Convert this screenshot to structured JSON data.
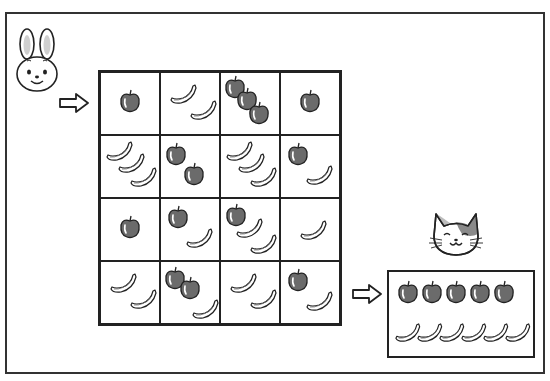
{
  "puzzle": {
    "title": "Fruit grid path puzzle",
    "start_character": "rabbit",
    "end_character": "cat",
    "grid": {
      "rows": 4,
      "cols": 4,
      "cells": [
        [
          {
            "apples": 1,
            "bananas": 0
          },
          {
            "apples": 0,
            "bananas": 2
          },
          {
            "apples": 3,
            "bananas": 0
          },
          {
            "apples": 1,
            "bananas": 0
          }
        ],
        [
          {
            "apples": 0,
            "bananas": 3
          },
          {
            "apples": 2,
            "bananas": 0
          },
          {
            "apples": 0,
            "bananas": 3
          },
          {
            "apples": 1,
            "bananas": 1
          }
        ],
        [
          {
            "apples": 1,
            "bananas": 0
          },
          {
            "apples": 1,
            "bananas": 1
          },
          {
            "apples": 1,
            "bananas": 2
          },
          {
            "apples": 0,
            "bananas": 1
          }
        ],
        [
          {
            "apples": 0,
            "bananas": 2
          },
          {
            "apples": 2,
            "bananas": 1
          },
          {
            "apples": 0,
            "bananas": 2
          },
          {
            "apples": 1,
            "bananas": 1
          }
        ]
      ]
    },
    "entry": {
      "row": 0,
      "side": "left"
    },
    "exit": {
      "row": 3,
      "side": "right"
    },
    "target": {
      "apples": 5,
      "bananas": 6
    }
  },
  "icons": {
    "start": "rabbit-face-icon",
    "end": "cat-face-icon",
    "arrow": "right-arrow-icon",
    "apple": "apple-icon",
    "banana": "banana-icon"
  },
  "colors": {
    "line": "#222222",
    "apple_fill": "#6b6b6b",
    "banana_fill": "#ffffff",
    "cat_patch": "#8a8a8a",
    "rabbit_ear": "#cfcfcf"
  }
}
